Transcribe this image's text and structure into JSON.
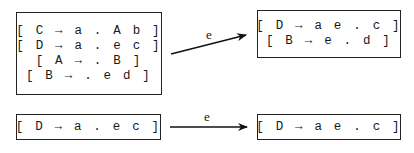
{
  "diagram": {
    "top": {
      "source_state": {
        "items": [
          "[ C → a . A b ]",
          "[ D → a . e c ]",
          "[ A → . B ]",
          "[ B → . e d ]"
        ]
      },
      "transition_label": "e",
      "target_state": {
        "items": [
          "[ D → a e . c ]",
          "[ B → e . d ]"
        ]
      }
    },
    "bottom": {
      "source_state": {
        "items": [
          "[ D → a . e c ]"
        ]
      },
      "transition_label": "e",
      "target_state": {
        "items": [
          "[ D → a e . c ]"
        ]
      }
    }
  }
}
